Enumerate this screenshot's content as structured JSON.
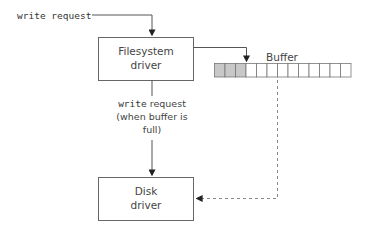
{
  "diagram": {
    "input_label": "write request",
    "filesystem_box": {
      "line1": "Filesystem",
      "line2": "driver"
    },
    "buffer": {
      "label": "Buffer",
      "cells_total": 13,
      "cells_filled": 3,
      "fill_color": "#c8c8c8"
    },
    "flush_label": {
      "line1_mono": "write",
      "line1_rest": " request",
      "line2": "(when buffer is",
      "line3": "full)"
    },
    "disk_box": {
      "line1": "Disk",
      "line2": "driver"
    },
    "colors": {
      "stroke": "#555555",
      "box_stroke": "#666666",
      "dashed": "#888888"
    }
  }
}
